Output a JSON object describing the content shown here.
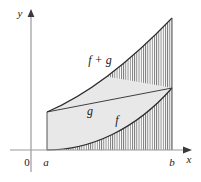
{
  "figure": {
    "background_color": "#ffffff",
    "axes": {
      "y_label": "y",
      "x_label": "x",
      "origin_label": "0",
      "axis_color": "#8c8c8c",
      "x_axis_y": 150,
      "y_axis_x": 31
    },
    "bounds": {
      "left_label": "a",
      "right_label": "b",
      "left_x": 47,
      "right_x": 172
    },
    "curves": [
      {
        "name": "f-plus-g",
        "label": "f + g",
        "label_x": 100,
        "label_y": 64,
        "stroke": "#2b2b2b",
        "start": [
          47,
          112
        ],
        "end": [
          172,
          18
        ]
      },
      {
        "name": "g",
        "label": "g",
        "label_x": 90,
        "label_y": 115,
        "stroke": "#2b2b2b",
        "start": [
          47,
          150
        ],
        "end": [
          172,
          88
        ]
      },
      {
        "name": "f",
        "label": "f",
        "label_x": 117,
        "label_y": 124,
        "stroke": "#2b2b2b",
        "start": [
          47,
          150
        ],
        "end": [
          172,
          88
        ]
      }
    ],
    "regions": [
      {
        "name": "upper-hatched-band",
        "description": "vertical hatching between f+g curve and g curve",
        "fill_pattern": "vertical-hatch",
        "hatch_color": "#6e6e6e"
      },
      {
        "name": "middle-gray-band",
        "description": "solid light gray region bounded above by f+g and below by f",
        "fill_color": "#e8e8e8"
      },
      {
        "name": "lower-hatched-region",
        "description": "vertical hatching between f curve and the x axis",
        "fill_pattern": "vertical-hatch",
        "hatch_color": "#6e6e6e"
      }
    ]
  }
}
